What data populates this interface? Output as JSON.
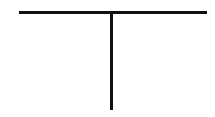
{
  "canvas": {
    "width": 215,
    "height": 117,
    "background_color": "#ffffff"
  },
  "figure": {
    "name": "t-shape-line-drawing",
    "stroke_color": "#111111",
    "stroke_width": 3,
    "strokes": [
      {
        "name": "horizontal-bar",
        "x1": 19,
        "y1": 12.5,
        "x2": 207,
        "y2": 12.5
      },
      {
        "name": "vertical-stem",
        "x1": 111.5,
        "y1": 12.5,
        "x2": 111.5,
        "y2": 110
      }
    ]
  }
}
